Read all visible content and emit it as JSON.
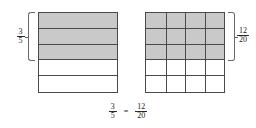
{
  "figure": {
    "title_visible": false,
    "background_color": "#ffffff",
    "outline_color": "#4a4a4a",
    "shade_color": "#c9c9c9",
    "text_color": "#1a1a1a"
  },
  "left_model": {
    "name": "fifths-bar-model",
    "total_parts": 5,
    "shaded_parts": 3,
    "columns": 1,
    "rows": 5,
    "orientation": "horizontal-rows",
    "shaded_row_indices": [
      0,
      1,
      2
    ],
    "label": {
      "numerator": "3",
      "denominator": "5"
    }
  },
  "right_model": {
    "name": "twentieths-grid-model",
    "total_parts": 20,
    "shaded_parts": 12,
    "columns": 4,
    "rows": 5,
    "orientation": "grid",
    "shaded_row_indices": [
      0,
      1,
      2
    ],
    "label": {
      "numerator": "12",
      "denominator": "20"
    }
  },
  "equation": {
    "left": {
      "numerator": "3",
      "denominator": "5"
    },
    "operator": "=",
    "right": {
      "numerator": "12",
      "denominator": "20"
    }
  }
}
